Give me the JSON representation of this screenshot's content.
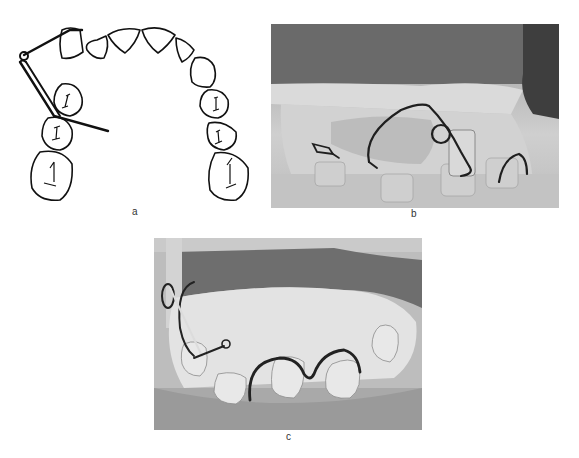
{
  "figure": {
    "panels": [
      {
        "id": "a",
        "label": "a",
        "kind": "line-drawing",
        "description": "Occlusal view of maxillary dental arch with wire appliance loop and arm"
      },
      {
        "id": "b",
        "label": "b",
        "kind": "photograph",
        "description": "Lateral view of dental cast with wire spring and coil"
      },
      {
        "id": "c",
        "label": "c",
        "kind": "photograph",
        "description": "Frontal view of dental cast with labial wire bows and spring"
      }
    ]
  },
  "colors": {
    "background": "#ffffff",
    "ink": "#111111",
    "photo_dark": "#5a5a5a",
    "photo_mid": "#9a9a9a",
    "photo_light": "#d8d8d8"
  }
}
